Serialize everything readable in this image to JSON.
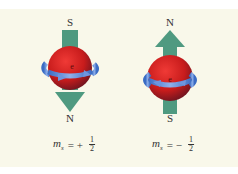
{
  "colors": {
    "panel_bg": "#f9f8ea",
    "arrow": "#4f9a80",
    "sphere": "#d42525",
    "ring": "#4a7fd0"
  },
  "left": {
    "top_label": "S",
    "bottom_label": "N",
    "electron_label": "e",
    "equation": {
      "symbol": "m",
      "subscript": "s",
      "sign": "= +",
      "numerator": "1",
      "denominator": "2"
    }
  },
  "right": {
    "top_label": "N",
    "bottom_label": "S",
    "electron_label": "e",
    "equation": {
      "symbol": "m",
      "subscript": "s",
      "sign": "= −",
      "numerator": "1",
      "denominator": "2"
    }
  }
}
